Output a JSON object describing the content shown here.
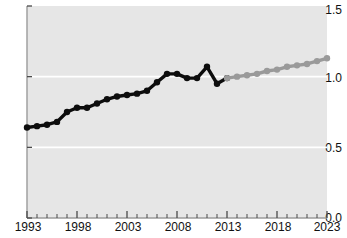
{
  "chart_data": {
    "type": "line",
    "title": "",
    "xlabel": "",
    "ylabel": "",
    "xlim": [
      1993,
      2023
    ],
    "ylim": [
      0.0,
      1.5
    ],
    "yticks": [
      0.0,
      0.5,
      1.0,
      1.5
    ],
    "ytick_labels": [
      "0.0",
      "0.5",
      "1.0",
      "1.5"
    ],
    "xticks": [
      1993,
      1998,
      2003,
      2008,
      2013,
      2018,
      2023
    ],
    "xtick_labels": [
      "1993",
      "1998",
      "2003",
      "2008",
      "2013",
      "2018",
      "2023"
    ],
    "minor_xticks_every": 1,
    "grid": "horizontal-white-gridlines-at-0.5-and-1.0",
    "legend": "none",
    "plot_background": "#e6e6e6",
    "series": [
      {
        "name": "historical",
        "color": "#0d0d0d",
        "marker": "circle",
        "x": [
          1993,
          1994,
          1995,
          1996,
          1997,
          1998,
          1999,
          2000,
          2001,
          2002,
          2003,
          2004,
          2005,
          2006,
          2007,
          2008,
          2009,
          2010,
          2011,
          2012,
          2013
        ],
        "values": [
          0.64,
          0.65,
          0.66,
          0.68,
          0.75,
          0.78,
          0.78,
          0.81,
          0.84,
          0.86,
          0.87,
          0.88,
          0.9,
          0.96,
          1.02,
          1.02,
          0.99,
          0.99,
          1.07,
          0.95,
          0.99
        ]
      },
      {
        "name": "forecast",
        "color": "#9a9a9a",
        "marker": "circle",
        "x": [
          2013,
          2014,
          2015,
          2016,
          2017,
          2018,
          2019,
          2020,
          2021,
          2022,
          2023
        ],
        "values": [
          0.99,
          1.0,
          1.01,
          1.02,
          1.04,
          1.05,
          1.07,
          1.08,
          1.09,
          1.11,
          1.13
        ]
      }
    ]
  }
}
